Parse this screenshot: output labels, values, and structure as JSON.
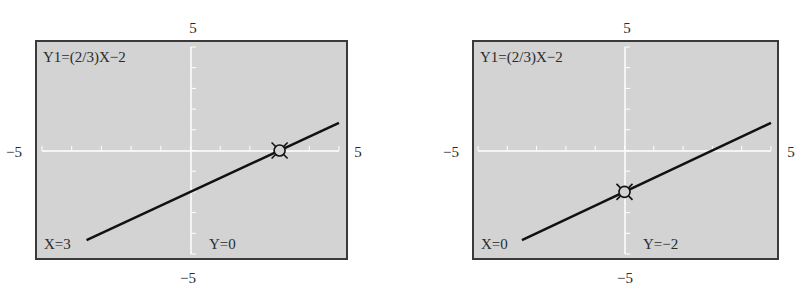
{
  "chart_data": [
    {
      "type": "line",
      "title": "Y1=(2/3)X-2",
      "equation": "Y1=(2/3)X−2",
      "slope": 0.6667,
      "intercept": -2,
      "xlim": [
        -5,
        5
      ],
      "ylim": [
        -5,
        5
      ],
      "window_labels": {
        "xmin": "−5",
        "xmax": "5",
        "ymin": "−5",
        "ymax": "5"
      },
      "grid": false,
      "axis_ticks": {
        "x": [
          -4,
          -3,
          -2,
          -1,
          0,
          1,
          2,
          3,
          4,
          5
        ],
        "y": [
          -4,
          -3,
          -2,
          -1,
          0,
          1,
          2,
          3,
          4,
          5
        ]
      },
      "x": [
        -3.5,
        5
      ],
      "values": [
        -4.333,
        1.333
      ],
      "trace_point": {
        "x": 3,
        "y": 0
      },
      "trace_labels": {
        "x": "X=3",
        "y": "Y=0"
      }
    },
    {
      "type": "line",
      "title": "Y1=(2/3)X-2",
      "equation": "Y1=(2/3)X−2",
      "slope": 0.6667,
      "intercept": -2,
      "xlim": [
        -5,
        5
      ],
      "ylim": [
        -5,
        5
      ],
      "window_labels": {
        "xmin": "−5",
        "xmax": "5",
        "ymin": "−5",
        "ymax": "5"
      },
      "grid": false,
      "axis_ticks": {
        "x": [
          -4,
          -3,
          -2,
          -1,
          0,
          1,
          2,
          3,
          4,
          5
        ],
        "y": [
          -4,
          -3,
          -2,
          -1,
          0,
          1,
          2,
          3,
          4,
          5
        ]
      },
      "x": [
        -3.5,
        5
      ],
      "values": [
        -4.333,
        1.333
      ],
      "trace_point": {
        "x": 0,
        "y": -2
      },
      "trace_labels": {
        "x": "X=0",
        "y": "Y=−2"
      }
    }
  ],
  "colors": {
    "screen_bg": "#d3d3d3",
    "frame_border": "#3a3a3a",
    "axes": "#ffffff",
    "graph_line": "#111111"
  }
}
